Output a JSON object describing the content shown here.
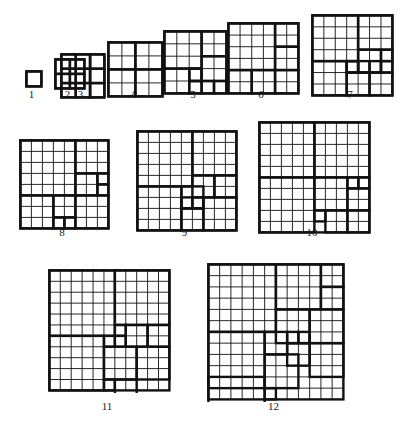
{
  "page": {
    "background_color": "#ffffff",
    "ink_color": "#111111",
    "thin_stroke": 0.9,
    "thick_stroke": 2.4
  },
  "figures": [
    {
      "label": "1",
      "order": 1,
      "x": 24,
      "y": 69,
      "size": 15,
      "n": 1,
      "label_x": 24,
      "label_y": 88,
      "label_w": 15,
      "squares": [
        [
          0,
          0,
          1
        ]
      ]
    },
    {
      "label": "2",
      "order": 2,
      "x": 53,
      "y": 57,
      "size": 29,
      "n": 2,
      "label_x": 53,
      "label_y": 88,
      "label_w": 29,
      "squares": [
        [
          0,
          0,
          1
        ],
        [
          1,
          0,
          1
        ],
        [
          0,
          1,
          1
        ],
        [
          1,
          1,
          1
        ]
      ]
    },
    {
      "label": "3",
      "order": 3,
      "x": 59,
      "y": 52,
      "size": 43,
      "n": 3,
      "label_x": 59,
      "label_y": 88,
      "label_w": 43,
      "squares": [
        [
          0,
          0,
          1
        ],
        [
          1,
          0,
          1
        ],
        [
          2,
          0,
          1
        ],
        [
          0,
          1,
          1
        ],
        [
          1,
          1,
          1
        ],
        [
          2,
          1,
          1
        ],
        [
          0,
          2,
          1
        ],
        [
          1,
          2,
          1
        ],
        [
          2,
          2,
          1
        ]
      ],
      "thick_segments": [
        [
          "v",
          2,
          0,
          3
        ]
      ]
    },
    {
      "label": "4",
      "order": 4,
      "x": 106,
      "y": 40,
      "size": 54,
      "n": 4,
      "label_x": 106,
      "label_y": 88,
      "label_w": 54,
      "squares": [
        [
          0,
          0,
          2
        ],
        [
          2,
          0,
          2
        ],
        [
          0,
          2,
          2
        ],
        [
          2,
          2,
          2
        ]
      ]
    },
    {
      "label": "5",
      "order": 5,
      "x": 162,
      "y": 29,
      "size": 62,
      "n": 5,
      "label_x": 162,
      "label_y": 88,
      "label_w": 62,
      "squares": [
        [
          0,
          0,
          3
        ],
        [
          3,
          0,
          2
        ],
        [
          3,
          2,
          2
        ],
        [
          0,
          3,
          2
        ],
        [
          2,
          3,
          1
        ],
        [
          2,
          4,
          1
        ],
        [
          3,
          4,
          1
        ],
        [
          4,
          4,
          1
        ],
        [
          2,
          3,
          1
        ]
      ]
    },
    {
      "label": "6",
      "order": 6,
      "x": 226,
      "y": 21,
      "size": 70,
      "n": 6,
      "label_x": 226,
      "label_y": 88,
      "label_w": 70,
      "squares": [
        [
          0,
          0,
          4
        ],
        [
          4,
          0,
          2
        ],
        [
          4,
          2,
          2
        ],
        [
          0,
          4,
          2
        ],
        [
          2,
          4,
          2
        ],
        [
          4,
          4,
          2
        ]
      ]
    },
    {
      "label": "7",
      "order": 7,
      "x": 310,
      "y": 13,
      "size": 80,
      "n": 7,
      "label_x": 310,
      "label_y": 88,
      "label_w": 80,
      "squares": [
        [
          0,
          0,
          4
        ],
        [
          4,
          0,
          3
        ],
        [
          4,
          3,
          2
        ],
        [
          6,
          3,
          1
        ],
        [
          6,
          4,
          1
        ],
        [
          0,
          4,
          3
        ],
        [
          3,
          4,
          1
        ],
        [
          3,
          5,
          2
        ],
        [
          5,
          5,
          2
        ],
        [
          4,
          4,
          1
        ],
        [
          5,
          4,
          1
        ],
        [
          3,
          4,
          1
        ]
      ]
    },
    {
      "label": "8",
      "order": 8,
      "x": 18,
      "y": 138,
      "size": 88,
      "n": 8,
      "label_x": 18,
      "label_y": 226,
      "label_w": 88,
      "squares": [
        [
          0,
          0,
          5
        ],
        [
          5,
          0,
          3
        ],
        [
          5,
          3,
          2
        ],
        [
          7,
          3,
          1
        ],
        [
          7,
          4,
          1
        ],
        [
          0,
          5,
          3
        ],
        [
          3,
          5,
          2
        ],
        [
          5,
          5,
          3
        ],
        [
          3,
          7,
          1
        ],
        [
          4,
          7,
          1
        ]
      ]
    },
    {
      "label": "9",
      "order": 9,
      "x": 135,
      "y": 129,
      "size": 99,
      "n": 9,
      "label_x": 135,
      "label_y": 226,
      "label_w": 99,
      "squares": [
        [
          0,
          0,
          5
        ],
        [
          5,
          0,
          4
        ],
        [
          5,
          4,
          2
        ],
        [
          7,
          4,
          2
        ],
        [
          0,
          5,
          4
        ],
        [
          4,
          5,
          2
        ],
        [
          4,
          7,
          2
        ],
        [
          6,
          6,
          3
        ],
        [
          4,
          6,
          1
        ],
        [
          5,
          6,
          1
        ]
      ]
    },
    {
      "label": "10",
      "order": 10,
      "x": 257,
      "y": 120,
      "size": 110,
      "n": 10,
      "label_x": 257,
      "label_y": 226,
      "label_w": 110,
      "squares": [
        [
          0,
          0,
          5
        ],
        [
          5,
          0,
          5
        ],
        [
          0,
          5,
          5
        ],
        [
          5,
          5,
          3
        ],
        [
          8,
          5,
          1
        ],
        [
          9,
          5,
          1
        ],
        [
          8,
          6,
          2
        ],
        [
          5,
          8,
          1
        ],
        [
          6,
          8,
          2
        ],
        [
          8,
          8,
          2
        ]
      ]
    },
    {
      "label": "11",
      "order": 11,
      "x": 47,
      "y": 268,
      "size": 120,
      "n": 11,
      "label_x": 47,
      "label_y": 400,
      "label_w": 120,
      "squares": [
        [
          0,
          0,
          6
        ],
        [
          6,
          0,
          5
        ],
        [
          6,
          5,
          1
        ],
        [
          7,
          5,
          2
        ],
        [
          9,
          5,
          2
        ],
        [
          0,
          6,
          5
        ],
        [
          5,
          6,
          1
        ],
        [
          6,
          6,
          1
        ],
        [
          5,
          7,
          3
        ],
        [
          8,
          7,
          3
        ],
        [
          5,
          10,
          1
        ],
        [
          6,
          10,
          2
        ]
      ]
    },
    {
      "label": "12",
      "order": 12,
      "x": 206,
      "y": 262,
      "size": 135,
      "n": 12,
      "label_x": 206,
      "label_y": 400,
      "label_w": 135,
      "squares": [
        [
          0,
          0,
          6
        ],
        [
          6,
          0,
          4
        ],
        [
          10,
          0,
          2
        ],
        [
          10,
          2,
          2
        ],
        [
          6,
          4,
          3
        ],
        [
          9,
          4,
          3
        ],
        [
          0,
          6,
          5
        ],
        [
          5,
          6,
          2
        ],
        [
          7,
          6,
          1
        ],
        [
          8,
          6,
          1
        ],
        [
          7,
          7,
          2
        ],
        [
          9,
          7,
          3
        ],
        [
          5,
          8,
          3
        ],
        [
          0,
          10,
          5
        ],
        [
          5,
          11,
          1
        ]
      ]
    }
  ]
}
